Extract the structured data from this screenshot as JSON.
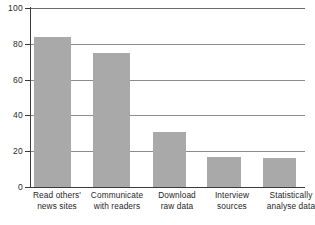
{
  "chart_data": {
    "type": "bar",
    "title": "",
    "subtitle": "",
    "xlabel": "",
    "ylabel": "",
    "ylim": [
      0,
      100
    ],
    "yticks": [
      0,
      20,
      40,
      60,
      80,
      100
    ],
    "ytick_labels": [
      "0",
      "20",
      "40",
      "60",
      "80",
      "100"
    ],
    "grid": true,
    "legend": false,
    "legend_position": "none",
    "bar_color": "#a9a9a9",
    "axis_color": "#3b3b3b",
    "gridline_color": "#8c8c8c",
    "categories": [
      "Read others' news sites",
      "Communicate with readers",
      "Download raw data",
      "Interview sources",
      "Statistically analyse data"
    ],
    "category_lines": [
      [
        "Read others'",
        "news sites"
      ],
      [
        "Communicate",
        "with readers"
      ],
      [
        "Download",
        "raw data"
      ],
      [
        "Interview",
        "sources"
      ],
      [
        "Statistically",
        "analyse data"
      ]
    ],
    "values": [
      84,
      75,
      31,
      17,
      16
    ]
  }
}
